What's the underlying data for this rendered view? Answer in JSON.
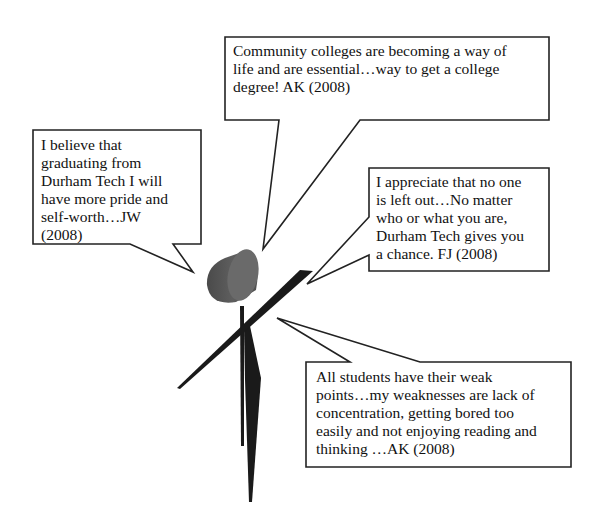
{
  "figure": {
    "title": "",
    "figure_type": "stick-figure-with-speech-bubbles",
    "colors": {
      "background": "#ffffff",
      "bubble_border": "#222222",
      "bubble_fill": "#ffffff",
      "text": "#111111",
      "head_body": "#555555",
      "head_face": "#6e6e6e",
      "stick": "#1a1a1a"
    }
  },
  "bubbles": [
    {
      "id": "top",
      "text": " Community colleges are becoming a way of\nlife and are essential…way to get a college\ndegree!  AK (2008)",
      "author": "AK",
      "year": "2008"
    },
    {
      "id": "left",
      "text": "I believe that\ngraduating from\nDurham Tech I will\nhave more pride and\nself-worth…JW\n(2008)",
      "author": "JW",
      "year": "2008"
    },
    {
      "id": "right",
      "text": "I appreciate that no one\nis left out…No matter\nwho or what you are,\nDurham Tech gives you\na chance.  FJ (2008)",
      "author": "FJ",
      "year": "2008"
    },
    {
      "id": "bottom",
      "text": "All students have their weak\npoints…my weaknesses are lack of\nconcentration,  getting bored too\neasily and not enjoying reading and\nthinking …AK (2008)",
      "author": "AK",
      "year": "2008"
    }
  ]
}
